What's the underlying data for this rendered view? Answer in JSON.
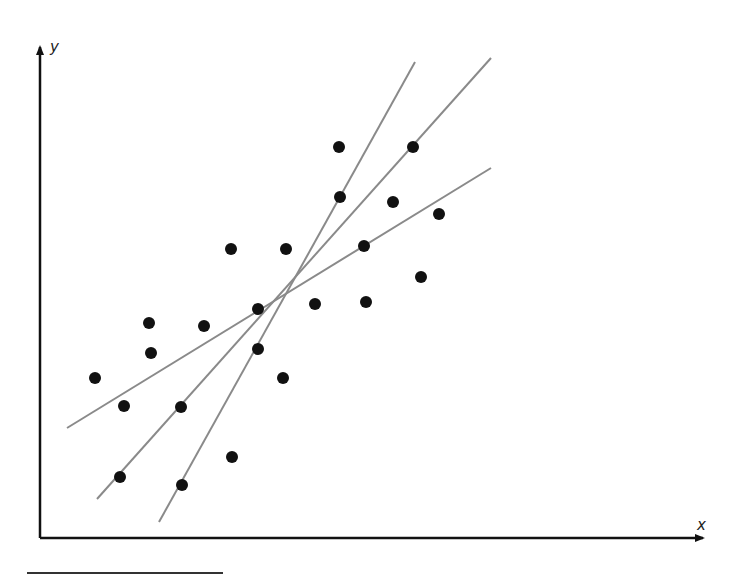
{
  "chart_data": {
    "type": "scatter",
    "title": "",
    "xlabel": "x",
    "ylabel": "y",
    "grid": false,
    "legend": null,
    "pixel_frame": {
      "origin": [
        40,
        538
      ],
      "x_end": 705,
      "y_end": 45
    },
    "points": [
      [
        95,
        378
      ],
      [
        124,
        406
      ],
      [
        120,
        477
      ],
      [
        149,
        323
      ],
      [
        151,
        353
      ],
      [
        181,
        407
      ],
      [
        182,
        485
      ],
      [
        204,
        326
      ],
      [
        231,
        249
      ],
      [
        232,
        457
      ],
      [
        258,
        309
      ],
      [
        258,
        349
      ],
      [
        283,
        378
      ],
      [
        286,
        249
      ],
      [
        315,
        304
      ],
      [
        339,
        147
      ],
      [
        340,
        197
      ],
      [
        364,
        246
      ],
      [
        366,
        302
      ],
      [
        393,
        202
      ],
      [
        413,
        147
      ],
      [
        421,
        277
      ],
      [
        439,
        214
      ]
    ],
    "lines": [
      {
        "name": "shallow-fit",
        "x1": 67,
        "y1": 428,
        "x2": 491,
        "y2": 168
      },
      {
        "name": "middle-fit",
        "x1": 97,
        "y1": 499,
        "x2": 491,
        "y2": 58
      },
      {
        "name": "steep-fit",
        "x1": 159,
        "y1": 522,
        "x2": 415,
        "y2": 62
      }
    ],
    "colors": {
      "points": "#111111",
      "lines": "#8a8a8a",
      "axes": "#111111"
    }
  },
  "labels": {
    "x_axis": "x",
    "y_axis": "y"
  }
}
